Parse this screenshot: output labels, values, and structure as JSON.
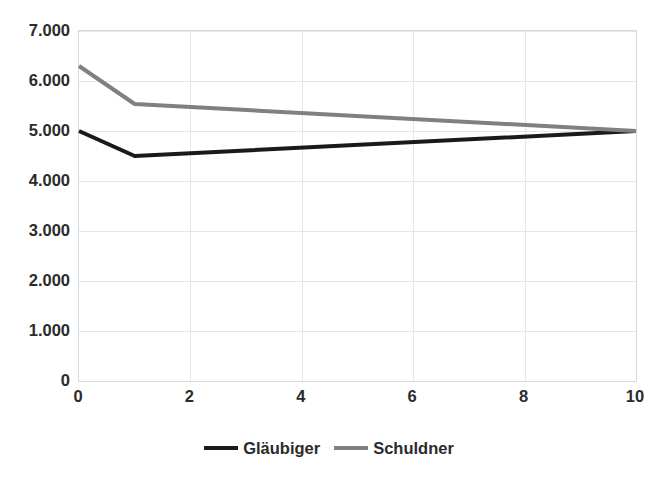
{
  "chart_data": {
    "type": "line",
    "title": "",
    "subtitle": "",
    "xlabel": "",
    "ylabel": "",
    "xlim": [
      0,
      10
    ],
    "ylim": [
      0,
      7000
    ],
    "grid": true,
    "legend_position": "bottom",
    "x_tick_labels": [
      "0",
      "2",
      "4",
      "6",
      "8",
      "10"
    ],
    "x_tick_values": [
      0,
      2,
      4,
      6,
      8,
      10
    ],
    "y_tick_labels": [
      "0",
      "1.000",
      "2.000",
      "3.000",
      "4.000",
      "5.000",
      "6.000",
      "7.000"
    ],
    "y_tick_values": [
      0,
      1000,
      2000,
      3000,
      4000,
      5000,
      6000,
      7000
    ],
    "x": [
      0,
      1,
      10
    ],
    "series": [
      {
        "name": "Gläubiger",
        "color": "#1a1a1a",
        "values": [
          5000,
          4500,
          5000
        ]
      },
      {
        "name": "Schuldner",
        "color": "#808080",
        "values": [
          6300,
          5540,
          5000
        ]
      }
    ]
  },
  "legend": {
    "entries": [
      {
        "label": "Gläubiger",
        "color": "#1a1a1a"
      },
      {
        "label": "Schuldner",
        "color": "#808080"
      }
    ]
  },
  "colors": {
    "glaeubiger": "#1a1a1a",
    "schuldner": "#808080",
    "gridline": "#e6e6e6",
    "axis": "#d9d9d9",
    "text": "#2b2b2b",
    "background": "#ffffff"
  }
}
